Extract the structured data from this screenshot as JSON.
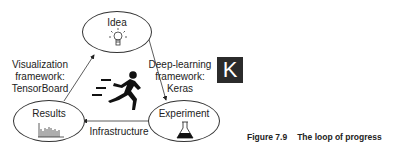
{
  "diagram": {
    "nodes": {
      "idea": {
        "label": "Idea",
        "icon": "lightbulb-icon"
      },
      "experiment": {
        "label": "Experiment",
        "icon": "flask-icon"
      },
      "results": {
        "label": "Results",
        "icon": "bar-chart-icon"
      }
    },
    "edges": {
      "results_to_idea": {
        "line1": "Visualization",
        "line2": "framework:",
        "line3": "TensorBoard"
      },
      "idea_to_experiment": {
        "line1": "Deep-learning",
        "line2": "framework:",
        "line3": "Keras"
      },
      "experiment_to_results": {
        "label": "Infrastructure"
      }
    },
    "center_icon": "running-person-icon",
    "logo": {
      "text": "K",
      "background": "#2b2b2b",
      "color": "#ffffff"
    }
  },
  "caption": {
    "number": "Figure 7.9",
    "title": "The loop of progress"
  }
}
